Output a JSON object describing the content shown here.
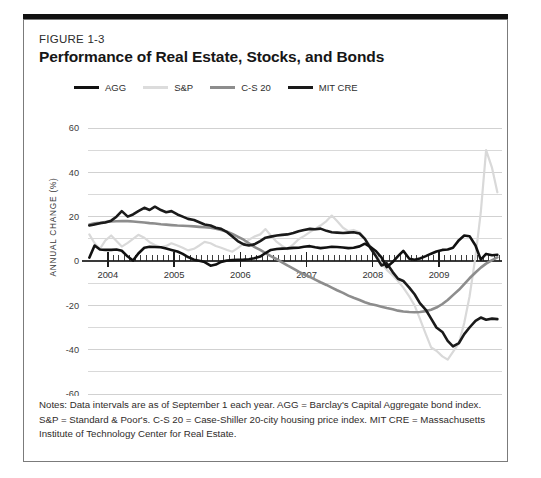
{
  "figure": {
    "number": "FIGURE 1-3",
    "title": "Performance of Real Estate, Stocks, and Bonds",
    "notes": "Notes: Data intervals are as of September 1 each year. AGG = Barclay's Capital Aggregate bond index. S&P = Standard & Poor's. C-S 20 = Case-Shiller 20-city housing price index. MIT CRE = Massachusetts Institute of Technology Center for Real Estate."
  },
  "colors": {
    "agg": "#111111",
    "sp": "#d9d9d9",
    "cs20": "#8d8d8d",
    "mitcre": "#1a1a1a",
    "grid": "#c9c9c9",
    "zero_line": "#3a3a3a",
    "box_border": "#7b7b7b",
    "top_rule": "#111111",
    "text": "#231f20"
  },
  "chart_data": {
    "type": "line",
    "title": "Performance of Real Estate, Stocks, and Bonds",
    "xlabel": "",
    "ylabel": "ANNUAL CHANGE (%)",
    "ylim": [
      -60,
      60
    ],
    "xlim": [
      2003.7,
      2009.95
    ],
    "yticks": [
      60,
      40,
      20,
      0,
      -20,
      -40,
      -60
    ],
    "ytick_labels": [
      "60",
      "40",
      "20",
      "0",
      "-20",
      "-40",
      "-60"
    ],
    "gridlines": [
      60,
      50,
      40,
      30,
      20,
      10,
      0,
      -10,
      -20,
      -30,
      -40,
      -50,
      -60
    ],
    "grid": true,
    "xticks": [
      2004,
      2005,
      2006,
      2007,
      2008,
      2009
    ],
    "xtick_labels": [
      "2004",
      "2005",
      "2006",
      "2007",
      "2008",
      "2009"
    ],
    "minor_xticks_per_year": 12,
    "legend_position": "top-left",
    "series": [
      {
        "name": "AGG",
        "color": "#111111",
        "width": 2.6,
        "x": [
          2003.72,
          2003.8,
          2003.88,
          2003.96,
          2004.05,
          2004.13,
          2004.21,
          2004.3,
          2004.38,
          2004.46,
          2004.55,
          2004.63,
          2004.71,
          2004.8,
          2004.88,
          2004.96,
          2005.05,
          2005.13,
          2005.21,
          2005.3,
          2005.38,
          2005.46,
          2005.55,
          2005.63,
          2005.71,
          2005.8,
          2005.88,
          2005.96,
          2006.05,
          2006.13,
          2006.21,
          2006.3,
          2006.38,
          2006.46,
          2006.55,
          2006.63,
          2006.71,
          2006.8,
          2006.88,
          2006.96,
          2007.05,
          2007.13,
          2007.21,
          2007.3,
          2007.38,
          2007.46,
          2007.55,
          2007.63,
          2007.71,
          2007.8,
          2007.88,
          2007.96,
          2008.05,
          2008.13,
          2008.21,
          2008.3,
          2008.38,
          2008.46,
          2008.55,
          2008.63,
          2008.71,
          2008.8,
          2008.88,
          2008.96,
          2009.05,
          2009.13,
          2009.21,
          2009.3,
          2009.38,
          2009.46,
          2009.55,
          2009.63,
          2009.71,
          2009.8,
          2009.88
        ],
        "values": [
          1.5,
          7.0,
          5.2,
          5.0,
          5.0,
          5.2,
          4.6,
          2.0,
          0.2,
          3.4,
          6.0,
          6.4,
          6.3,
          6.2,
          5.6,
          5.0,
          4.3,
          3.2,
          1.8,
          0.6,
          0.1,
          -0.5,
          -2.1,
          -1.6,
          -0.4,
          0.2,
          0.4,
          0.5,
          0.6,
          0.8,
          1.2,
          2.0,
          3.6,
          5.0,
          5.4,
          5.6,
          5.7,
          5.9,
          6.0,
          6.4,
          6.7,
          6.2,
          5.8,
          6.1,
          6.4,
          6.3,
          6.1,
          5.8,
          6.0,
          6.6,
          7.8,
          6.4,
          4.4,
          1.6,
          -2.8,
          -0.5,
          2.2,
          4.6,
          1.0,
          0.6,
          1.1,
          2.2,
          3.3,
          4.3,
          5.0,
          5.2,
          6.0,
          9.4,
          11.5,
          11.2,
          7.0,
          0.6,
          3.2,
          2.6,
          2.8
        ]
      },
      {
        "name": "S&P",
        "color": "#d9d9d9",
        "width": 2.2,
        "x": [
          2003.72,
          2003.8,
          2003.88,
          2003.96,
          2004.05,
          2004.13,
          2004.21,
          2004.3,
          2004.38,
          2004.46,
          2004.55,
          2004.63,
          2004.71,
          2004.8,
          2004.88,
          2004.96,
          2005.05,
          2005.13,
          2005.21,
          2005.3,
          2005.38,
          2005.46,
          2005.55,
          2005.63,
          2005.71,
          2005.8,
          2005.88,
          2005.96,
          2006.05,
          2006.13,
          2006.21,
          2006.3,
          2006.38,
          2006.46,
          2006.55,
          2006.63,
          2006.71,
          2006.8,
          2006.88,
          2006.96,
          2007.05,
          2007.13,
          2007.21,
          2007.3,
          2007.38,
          2007.46,
          2007.55,
          2007.63,
          2007.71,
          2007.8,
          2007.88,
          2007.96,
          2008.05,
          2008.13,
          2008.21,
          2008.3,
          2008.38,
          2008.46,
          2008.55,
          2008.63,
          2008.71,
          2008.8,
          2008.88,
          2008.96,
          2009.05,
          2009.13,
          2009.21,
          2009.3,
          2009.38,
          2009.46,
          2009.55,
          2009.63,
          2009.71,
          2009.8,
          2009.88
        ],
        "values": [
          12.0,
          8.0,
          5.5,
          9.2,
          11.5,
          9.0,
          6.5,
          8.2,
          10.0,
          11.8,
          10.5,
          8.5,
          7.2,
          6.2,
          6.8,
          8.0,
          7.0,
          6.0,
          4.8,
          5.5,
          7.0,
          8.6,
          8.0,
          6.8,
          6.0,
          5.0,
          4.2,
          5.8,
          7.8,
          9.6,
          11.0,
          12.0,
          14.4,
          11.5,
          8.6,
          6.8,
          5.4,
          7.5,
          9.8,
          11.2,
          13.0,
          14.5,
          16.0,
          18.0,
          20.5,
          18.0,
          15.0,
          13.5,
          14.0,
          13.0,
          10.0,
          7.0,
          3.0,
          -1.0,
          -4.0,
          -6.5,
          -9.0,
          -12.0,
          -16.0,
          -20.0,
          -26.0,
          -33.0,
          -39.0,
          -40.5,
          -43.0,
          -44.5,
          -41.0,
          -37.0,
          -28.0,
          -16.0,
          2.0,
          22.0,
          50.0,
          42.0,
          31.0
        ]
      },
      {
        "name": "C-S 20",
        "color": "#8d8d8d",
        "width": 2.6,
        "x": [
          2003.72,
          2003.8,
          2003.88,
          2003.96,
          2004.05,
          2004.13,
          2004.21,
          2004.3,
          2004.38,
          2004.46,
          2004.55,
          2004.63,
          2004.71,
          2004.8,
          2004.88,
          2004.96,
          2005.05,
          2005.13,
          2005.21,
          2005.3,
          2005.38,
          2005.46,
          2005.55,
          2005.63,
          2005.71,
          2005.8,
          2005.88,
          2005.96,
          2006.05,
          2006.13,
          2006.21,
          2006.3,
          2006.38,
          2006.46,
          2006.55,
          2006.63,
          2006.71,
          2006.8,
          2006.88,
          2006.96,
          2007.05,
          2007.13,
          2007.21,
          2007.3,
          2007.38,
          2007.46,
          2007.55,
          2007.63,
          2007.71,
          2007.8,
          2007.88,
          2007.96,
          2008.05,
          2008.13,
          2008.21,
          2008.3,
          2008.38,
          2008.46,
          2008.55,
          2008.63,
          2008.71,
          2008.8,
          2008.88,
          2008.96,
          2009.05,
          2009.13,
          2009.21,
          2009.3,
          2009.38,
          2009.46,
          2009.55,
          2009.63,
          2009.71,
          2009.8,
          2009.88
        ],
        "values": [
          16.5,
          17.0,
          17.2,
          17.6,
          17.8,
          17.9,
          18.0,
          18.0,
          17.8,
          17.6,
          17.4,
          17.1,
          16.9,
          16.6,
          16.4,
          16.2,
          16.0,
          15.9,
          15.8,
          15.6,
          15.4,
          15.2,
          15.0,
          14.6,
          14.0,
          13.2,
          12.2,
          11.0,
          9.6,
          8.0,
          6.4,
          5.0,
          3.6,
          2.2,
          0.8,
          -0.6,
          -2.0,
          -3.4,
          -4.8,
          -6.0,
          -7.2,
          -8.4,
          -9.6,
          -10.8,
          -12.0,
          -13.2,
          -14.4,
          -15.6,
          -16.6,
          -17.6,
          -18.6,
          -19.4,
          -20.0,
          -20.6,
          -21.2,
          -21.8,
          -22.4,
          -22.8,
          -23.0,
          -23.1,
          -23.0,
          -22.6,
          -22.0,
          -21.0,
          -19.4,
          -17.6,
          -15.4,
          -13.0,
          -10.4,
          -7.8,
          -5.2,
          -3.0,
          -1.2,
          0.4,
          1.6
        ]
      },
      {
        "name": "MIT CRE",
        "color": "#1a1a1a",
        "width": 2.6,
        "x": [
          2003.72,
          2003.8,
          2003.88,
          2003.96,
          2004.05,
          2004.13,
          2004.21,
          2004.3,
          2004.38,
          2004.46,
          2004.55,
          2004.63,
          2004.71,
          2004.8,
          2004.88,
          2004.96,
          2005.05,
          2005.13,
          2005.21,
          2005.3,
          2005.38,
          2005.46,
          2005.55,
          2005.63,
          2005.71,
          2005.8,
          2005.88,
          2005.96,
          2006.05,
          2006.13,
          2006.21,
          2006.3,
          2006.38,
          2006.46,
          2006.55,
          2006.63,
          2006.71,
          2006.8,
          2006.88,
          2006.96,
          2007.05,
          2007.13,
          2007.21,
          2007.3,
          2007.38,
          2007.46,
          2007.55,
          2007.63,
          2007.71,
          2007.8,
          2007.88,
          2007.96,
          2008.05,
          2008.13,
          2008.21,
          2008.3,
          2008.38,
          2008.46,
          2008.55,
          2008.63,
          2008.71,
          2008.8,
          2008.88,
          2008.96,
          2009.05,
          2009.13,
          2009.21,
          2009.3,
          2009.38,
          2009.46,
          2009.55,
          2009.63,
          2009.71,
          2009.8,
          2009.88
        ],
        "values": [
          16.0,
          16.5,
          17.0,
          17.4,
          18.2,
          20.0,
          22.5,
          20.0,
          21.0,
          22.5,
          24.0,
          23.0,
          24.5,
          23.0,
          22.0,
          22.5,
          21.0,
          20.0,
          19.0,
          18.5,
          17.5,
          16.5,
          16.0,
          15.0,
          14.5,
          13.0,
          11.0,
          9.0,
          7.5,
          7.0,
          7.5,
          9.0,
          10.5,
          11.0,
          11.5,
          11.8,
          12.0,
          12.6,
          13.4,
          14.0,
          14.5,
          14.3,
          14.6,
          13.6,
          13.0,
          12.8,
          12.6,
          12.8,
          13.0,
          12.4,
          10.0,
          6.0,
          2.0,
          -2.0,
          -1.0,
          -5.0,
          -8.0,
          -9.0,
          -12.0,
          -15.0,
          -19.0,
          -22.0,
          -26.0,
          -30.0,
          -32.0,
          -36.0,
          -38.5,
          -37.0,
          -33.0,
          -30.0,
          -27.0,
          -25.5,
          -26.5,
          -26.0,
          -26.2
        ]
      }
    ]
  },
  "legend": {
    "items": [
      {
        "label": "AGG",
        "color": "#111111",
        "thickness": 3.2
      },
      {
        "label": "S&P",
        "color": "#dcdcdc",
        "thickness": 2.4
      },
      {
        "label": "C-S 20",
        "color": "#8d8d8d",
        "thickness": 2.8
      },
      {
        "label": "MIT CRE",
        "color": "#1a1a1a",
        "thickness": 3.4
      }
    ]
  }
}
